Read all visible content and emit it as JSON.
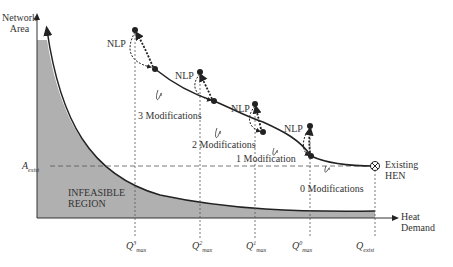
{
  "diagram": {
    "y_axis_label": [
      "Network",
      "Area"
    ],
    "x_axis_label": [
      "Heat",
      "Demand"
    ],
    "region_label": [
      "INFEASIBLE",
      "REGION"
    ],
    "existing_label": [
      "Existing",
      "HEN"
    ],
    "a_exist_label": {
      "base": "A",
      "sub": "exist"
    },
    "nlp_label": "NLP",
    "modifications": [
      "3 Modifications",
      "2 Modifications",
      "1 Modification",
      "0 Modifications"
    ],
    "q_ticks": [
      {
        "base": "Q",
        "sup": "3",
        "sub": "max"
      },
      {
        "base": "Q",
        "sup": "2",
        "sub": "max"
      },
      {
        "base": "Q",
        "sup": "1",
        "sub": "max"
      },
      {
        "base": "Q",
        "sup": "0",
        "sub": "max"
      },
      {
        "base": "Q",
        "sup": "",
        "sub": "exist"
      }
    ],
    "colors": {
      "fill": "#b0b0b0",
      "line": "#222222",
      "dash": "#555555"
    }
  }
}
